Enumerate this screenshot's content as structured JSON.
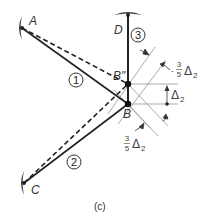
{
  "figure": {
    "caption": "(c)",
    "colors": {
      "member": "#222222",
      "support": "#333333",
      "construction": "#888888",
      "text": "#333333"
    },
    "nodes": {
      "A": {
        "label": "A",
        "x": 22,
        "y": 28
      },
      "D": {
        "label": "D",
        "x": 128,
        "y": 15
      },
      "C": {
        "label": "C",
        "x": 24,
        "y": 183
      },
      "B": {
        "label": "B",
        "x": 128,
        "y": 104
      },
      "B_displaced": {
        "label": "B\"",
        "x": 128,
        "y": 84
      }
    },
    "members": [
      {
        "id": "1",
        "label": "1",
        "from": "A",
        "to": "B"
      },
      {
        "id": "2",
        "label": "2",
        "from": "C",
        "to": "B"
      },
      {
        "id": "3",
        "label": "3",
        "from": "D",
        "to": "B"
      }
    ],
    "displaced_members": [
      {
        "from": "A",
        "to": "B\"",
        "style": "dashed"
      },
      {
        "from": "C",
        "to": "B\"",
        "style": "dashed"
      }
    ],
    "annotations": {
      "vertical_displacement": {
        "symbol": "Δ",
        "subscript": "2"
      },
      "member1_elongation": {
        "sign": "-",
        "numerator": "3",
        "denominator": "5",
        "symbol": "Δ",
        "subscript": "2"
      },
      "member2_elongation": {
        "numerator": "3",
        "denominator": "5",
        "symbol": "Δ",
        "subscript": "2"
      }
    }
  }
}
